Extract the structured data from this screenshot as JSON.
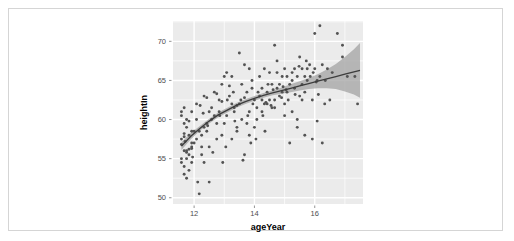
{
  "figure": {
    "background": "#ffffff",
    "border_color": "#d5d5d5",
    "panel_background": "#ebebeb",
    "grid_color": "#ffffff",
    "point_color": "#535353",
    "line_color": "#3c3c3c",
    "ribbon_color": "#9f9f9f"
  },
  "chart_data": {
    "type": "scatter",
    "title": "",
    "xlabel": "ageYear",
    "ylabel": "heightIn",
    "xlim": [
      11.3,
      17.6
    ],
    "ylim": [
      49.2,
      72.6
    ],
    "xticks": [
      12,
      14,
      16
    ],
    "yticks": [
      50,
      55,
      60,
      65,
      70
    ],
    "xtick_labels": [
      "12",
      "14",
      "16"
    ],
    "ytick_labels": [
      "50",
      "55",
      "60",
      "65",
      "70"
    ],
    "grid": true,
    "legend": "none",
    "smoother": {
      "method": "loess",
      "show_confidence_band": true,
      "band_level": 0.95,
      "x": [
        11.58,
        11.9,
        12.2,
        12.5,
        12.8,
        13.1,
        13.4,
        13.7,
        14.0,
        14.3,
        14.6,
        14.9,
        15.2,
        15.5,
        15.8,
        16.1,
        16.4,
        16.7,
        17.0,
        17.3,
        17.5
      ],
      "y": [
        56.6,
        57.9,
        58.9,
        59.8,
        60.6,
        61.2,
        61.8,
        62.3,
        62.7,
        63.1,
        63.4,
        63.7,
        64.0,
        64.3,
        64.6,
        64.9,
        65.2,
        65.5,
        65.8,
        66.1,
        66.3
      ],
      "ymin": [
        56.1,
        57.5,
        58.6,
        59.5,
        60.3,
        60.9,
        61.5,
        62.0,
        62.4,
        62.8,
        63.1,
        63.3,
        63.5,
        63.7,
        63.9,
        64.0,
        64.0,
        63.9,
        63.6,
        63.2,
        62.8
      ],
      "ymax": [
        57.1,
        58.3,
        59.2,
        60.1,
        60.9,
        61.5,
        62.1,
        62.6,
        63.0,
        63.4,
        63.7,
        64.1,
        64.5,
        64.9,
        65.3,
        65.8,
        66.4,
        67.1,
        68.0,
        69.0,
        69.8
      ]
    },
    "points": [
      [
        11.92,
        56.3
      ],
      [
        12.92,
        62.3
      ],
      [
        12.75,
        63.3
      ],
      [
        13.42,
        59.0
      ],
      [
        15.92,
        62.5
      ],
      [
        14.25,
        62.5
      ],
      [
        15.42,
        59.0
      ],
      [
        11.92,
        56.5
      ],
      [
        13.17,
        64.3
      ],
      [
        13.83,
        61.0
      ],
      [
        16.08,
        65.0
      ],
      [
        14.67,
        62.5
      ],
      [
        11.67,
        56.0
      ],
      [
        14.92,
        63.5
      ],
      [
        16.17,
        65.5
      ],
      [
        13.25,
        62.0
      ],
      [
        12.42,
        59.5
      ],
      [
        11.75,
        55.0
      ],
      [
        12.25,
        58.0
      ],
      [
        16.58,
        66.0
      ],
      [
        15.58,
        64.5
      ],
      [
        13.67,
        62.8
      ],
      [
        11.58,
        54.5
      ],
      [
        12.08,
        57.5
      ],
      [
        14.17,
        63.0
      ],
      [
        15.08,
        65.5
      ],
      [
        11.83,
        55.5
      ],
      [
        13.92,
        64.0
      ],
      [
        16.42,
        66.5
      ],
      [
        12.58,
        60.0
      ],
      [
        14.42,
        63.5
      ],
      [
        12.83,
        61.0
      ],
      [
        11.67,
        53.0
      ],
      [
        15.25,
        66.0
      ],
      [
        13.08,
        60.5
      ],
      [
        14.75,
        64.0
      ],
      [
        16.92,
        68.0
      ],
      [
        12.17,
        58.5
      ],
      [
        15.75,
        65.0
      ],
      [
        13.5,
        62.0
      ],
      [
        11.92,
        57.0
      ],
      [
        14.08,
        61.5
      ],
      [
        12.33,
        59.0
      ],
      [
        16.25,
        67.0
      ],
      [
        15.5,
        63.0
      ],
      [
        13.75,
        63.5
      ],
      [
        11.75,
        56.0
      ],
      [
        12.67,
        60.5
      ],
      [
        14.58,
        64.5
      ],
      [
        17.08,
        65.5
      ],
      [
        11.58,
        57.5
      ],
      [
        12.0,
        58.5
      ],
      [
        13.33,
        61.5
      ],
      [
        14.33,
        62.0
      ],
      [
        15.17,
        64.5
      ],
      [
        16.0,
        71.0
      ],
      [
        11.67,
        54.0
      ],
      [
        12.5,
        61.0
      ],
      [
        13.58,
        60.0
      ],
      [
        14.83,
        63.0
      ],
      [
        15.67,
        65.5
      ],
      [
        16.75,
        71.0
      ],
      [
        11.83,
        58.0
      ],
      [
        12.25,
        56.5
      ],
      [
        13.0,
        65.5
      ],
      [
        14.0,
        62.5
      ],
      [
        15.0,
        62.0
      ],
      [
        16.08,
        59.8
      ],
      [
        11.75,
        59.0
      ],
      [
        12.92,
        58.0
      ],
      [
        13.83,
        66.5
      ],
      [
        14.5,
        66.0
      ],
      [
        15.33,
        66.5
      ],
      [
        16.33,
        62.0
      ],
      [
        11.58,
        60.5
      ],
      [
        12.42,
        62.8
      ],
      [
        13.25,
        57.5
      ],
      [
        14.25,
        64.0
      ],
      [
        15.58,
        66.5
      ],
      [
        17.42,
        62.0
      ],
      [
        11.67,
        61.5
      ],
      [
        12.08,
        60.0
      ],
      [
        13.42,
        58.5
      ],
      [
        14.17,
        65.5
      ],
      [
        15.25,
        61.0
      ],
      [
        16.5,
        62.5
      ],
      [
        11.92,
        61.0
      ],
      [
        12.75,
        59.5
      ],
      [
        13.67,
        67.0
      ],
      [
        14.67,
        69.5
      ],
      [
        15.42,
        60.0
      ],
      [
        16.17,
        72.0
      ],
      [
        11.75,
        52.5
      ],
      [
        12.33,
        54.5
      ],
      [
        13.08,
        66.0
      ],
      [
        14.33,
        66.5
      ],
      [
        15.0,
        66.5
      ],
      [
        16.0,
        66.5
      ],
      [
        11.58,
        55.0
      ],
      [
        12.17,
        50.5
      ],
      [
        13.5,
        68.5
      ],
      [
        14.75,
        67.5
      ],
      [
        15.83,
        67.0
      ],
      [
        16.92,
        69.5
      ],
      [
        11.83,
        53.5
      ],
      [
        12.5,
        52.0
      ],
      [
        13.92,
        65.0
      ],
      [
        14.92,
        65.5
      ],
      [
        15.67,
        58.0
      ],
      [
        17.33,
        65.5
      ],
      [
        11.67,
        59.5
      ],
      [
        12.0,
        57.0
      ],
      [
        13.17,
        63.0
      ],
      [
        14.42,
        62.0
      ],
      [
        15.17,
        57.0
      ],
      [
        16.25,
        57.0
      ],
      [
        11.92,
        58.5
      ],
      [
        12.83,
        62.5
      ],
      [
        13.75,
        59.5
      ],
      [
        14.08,
        60.0
      ],
      [
        15.92,
        57.5
      ],
      [
        11.75,
        60.0
      ],
      [
        12.67,
        63.5
      ],
      [
        13.33,
        61.0
      ],
      [
        14.58,
        61.5
      ],
      [
        15.5,
        68.0
      ],
      [
        11.58,
        56.8
      ],
      [
        12.25,
        55.5
      ],
      [
        13.0,
        59.5
      ],
      [
        14.83,
        64.5
      ],
      [
        15.75,
        66.5
      ],
      [
        11.67,
        57.8
      ],
      [
        12.92,
        64.5
      ],
      [
        13.58,
        64.5
      ],
      [
        14.25,
        61.0
      ],
      [
        15.33,
        64.0
      ],
      [
        11.83,
        59.8
      ],
      [
        12.42,
        58.5
      ],
      [
        13.83,
        58.0
      ],
      [
        14.5,
        62.5
      ],
      [
        15.08,
        63.5
      ],
      [
        11.75,
        55.8
      ],
      [
        12.58,
        61.5
      ],
      [
        13.25,
        65.5
      ],
      [
        14.0,
        59.0
      ],
      [
        15.42,
        65.5
      ],
      [
        11.92,
        54.5
      ],
      [
        12.08,
        62.0
      ],
      [
        13.67,
        55.5
      ],
      [
        14.67,
        61.5
      ],
      [
        15.25,
        65.0
      ],
      [
        11.67,
        58.2
      ],
      [
        12.33,
        63.0
      ],
      [
        13.42,
        61.8
      ],
      [
        14.35,
        58.5
      ],
      [
        15.0,
        60.5
      ],
      [
        11.58,
        61.0
      ],
      [
        12.5,
        56.5
      ],
      [
        13.1,
        62.5
      ],
      [
        14.75,
        66.0
      ],
      [
        15.58,
        62.5
      ],
      [
        11.83,
        56.2
      ],
      [
        12.75,
        57.5
      ],
      [
        13.95,
        62.0
      ],
      [
        14.12,
        63.5
      ],
      [
        15.67,
        63.5
      ],
      [
        11.7,
        57.2
      ],
      [
        12.85,
        60.5
      ],
      [
        13.3,
        63.5
      ],
      [
        14.45,
        64.5
      ],
      [
        15.85,
        65.5
      ],
      [
        11.95,
        55.2
      ],
      [
        12.2,
        61.8
      ],
      [
        13.55,
        62.5
      ],
      [
        14.9,
        62.8
      ],
      [
        15.12,
        62.5
      ],
      [
        12.62,
        55.8
      ],
      [
        13.78,
        60.5
      ],
      [
        14.28,
        60.5
      ],
      [
        15.35,
        63.2
      ],
      [
        12.95,
        54.5
      ],
      [
        13.62,
        54.8
      ],
      [
        14.55,
        61.8
      ],
      [
        15.72,
        67.5
      ],
      [
        12.12,
        52.0
      ],
      [
        13.88,
        57.0
      ],
      [
        14.05,
        57.5
      ],
      [
        15.48,
        66.8
      ],
      [
        12.45,
        59.2
      ],
      [
        13.05,
        56.5
      ],
      [
        14.62,
        63.8
      ],
      [
        15.95,
        66.0
      ],
      [
        16.05,
        64.8
      ],
      [
        16.12,
        63.2
      ],
      [
        16.35,
        65.0
      ],
      [
        14.38,
        62.2
      ],
      [
        14.95,
        64.2
      ],
      [
        15.05,
        63.8
      ],
      [
        13.35,
        59.8
      ],
      [
        12.3,
        60.8
      ]
    ]
  }
}
